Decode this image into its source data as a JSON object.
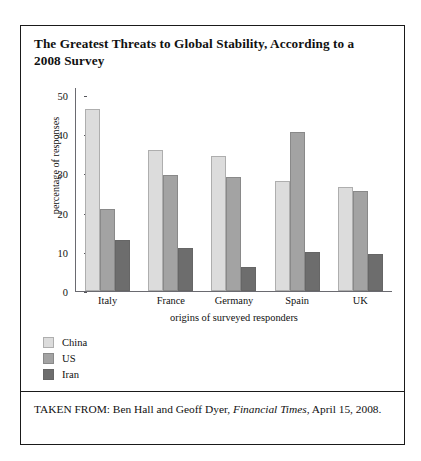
{
  "figure": {
    "title": "The Greatest Threats to Global Stability, According to a 2008 Survey",
    "source_prefix": "TAKEN FROM: Ben Hall and Geoff Dyer, ",
    "source_italic": "Financial Times",
    "source_suffix": ", April 15, 2008."
  },
  "colors": {
    "china": "#dcdcdc",
    "us": "#a3a3a3",
    "iran": "#6d6d6d",
    "frame": "#1a1a1a",
    "axis": "#6a6a70"
  },
  "chart_data": {
    "type": "bar",
    "title": "The Greatest Threats to Global Stability, According to a 2008 Survey",
    "xlabel": "origins of surveyed responders",
    "ylabel": "percentage of responses",
    "categories": [
      "Italy",
      "France",
      "Germany",
      "Spain",
      "UK"
    ],
    "yticks": [
      0,
      10,
      20,
      30,
      40,
      50
    ],
    "ylim": [
      0,
      52
    ],
    "grid": false,
    "legend_position": "below-left",
    "series": [
      {
        "name": "China",
        "color": "#dcdcdc",
        "values": [
          46.5,
          36,
          34.5,
          28,
          26.5
        ]
      },
      {
        "name": "US",
        "color": "#a3a3a3",
        "values": [
          21,
          29.5,
          29,
          40.5,
          25.5
        ]
      },
      {
        "name": "Iran",
        "color": "#6d6d6d",
        "values": [
          13,
          11,
          6,
          10,
          9.5
        ]
      }
    ]
  }
}
